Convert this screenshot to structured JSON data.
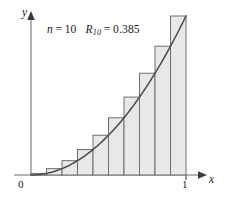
{
  "figure": {
    "annotation": {
      "n_symbol": "n",
      "n_equals": "=",
      "n_value": "10",
      "r_symbol": "R",
      "r_subscript": "10",
      "r_equals": "=",
      "r_value": "0.385",
      "full_text": "n = 10   R10 = 0.385"
    },
    "axes": {
      "y_label": "y",
      "x_label": "x",
      "origin_label": "0",
      "x_tick_label": "1"
    },
    "colors": {
      "bar_fill": "#e8e8e8",
      "bar_stroke": "#6e6e6e",
      "curve": "#4a4a4a",
      "axis": "#b4b4b4",
      "arrow": "#3a3a3a",
      "text": "#1a1a1a",
      "background": "#ffffff"
    }
  },
  "chart_data": {
    "type": "bar",
    "title": "",
    "subtitle": "",
    "xlabel": "x",
    "ylabel": "y",
    "xlim": [
      0,
      1
    ],
    "ylim": [
      0,
      1
    ],
    "grid": false,
    "legend": null,
    "n": 10,
    "method": "right endpoint Riemann sum",
    "function": "y = x^2",
    "riemann_sum": 0.385,
    "annotations": [
      "n = 10",
      "R10 = 0.385"
    ],
    "x_ticks": [
      0,
      1
    ],
    "x_tick_labels": [
      "0",
      "1"
    ],
    "y_ticks": [],
    "y_tick_labels": [],
    "bar_width": 0.1,
    "categories": [
      "0.0-0.1",
      "0.1-0.2",
      "0.2-0.3",
      "0.3-0.4",
      "0.4-0.5",
      "0.5-0.6",
      "0.6-0.7",
      "0.7-0.8",
      "0.8-0.9",
      "0.9-1.0"
    ],
    "right_endpoints": [
      0.1,
      0.2,
      0.3,
      0.4,
      0.5,
      0.6,
      0.7,
      0.8,
      0.9,
      1.0
    ],
    "values": [
      0.01,
      0.04,
      0.09,
      0.16,
      0.25,
      0.36,
      0.49,
      0.64,
      0.81,
      1.0
    ],
    "series": [
      {
        "name": "Right endpoint rectangles",
        "values": [
          0.01,
          0.04,
          0.09,
          0.16,
          0.25,
          0.36,
          0.49,
          0.64,
          0.81,
          1.0
        ]
      },
      {
        "name": "y = x^2",
        "type": "line",
        "x": [
          0.0,
          0.1,
          0.2,
          0.3,
          0.4,
          0.5,
          0.6,
          0.7,
          0.8,
          0.9,
          1.0
        ],
        "y": [
          0.0,
          0.01,
          0.04,
          0.09,
          0.16,
          0.25,
          0.36,
          0.49,
          0.64,
          0.81,
          1.0
        ]
      }
    ]
  }
}
